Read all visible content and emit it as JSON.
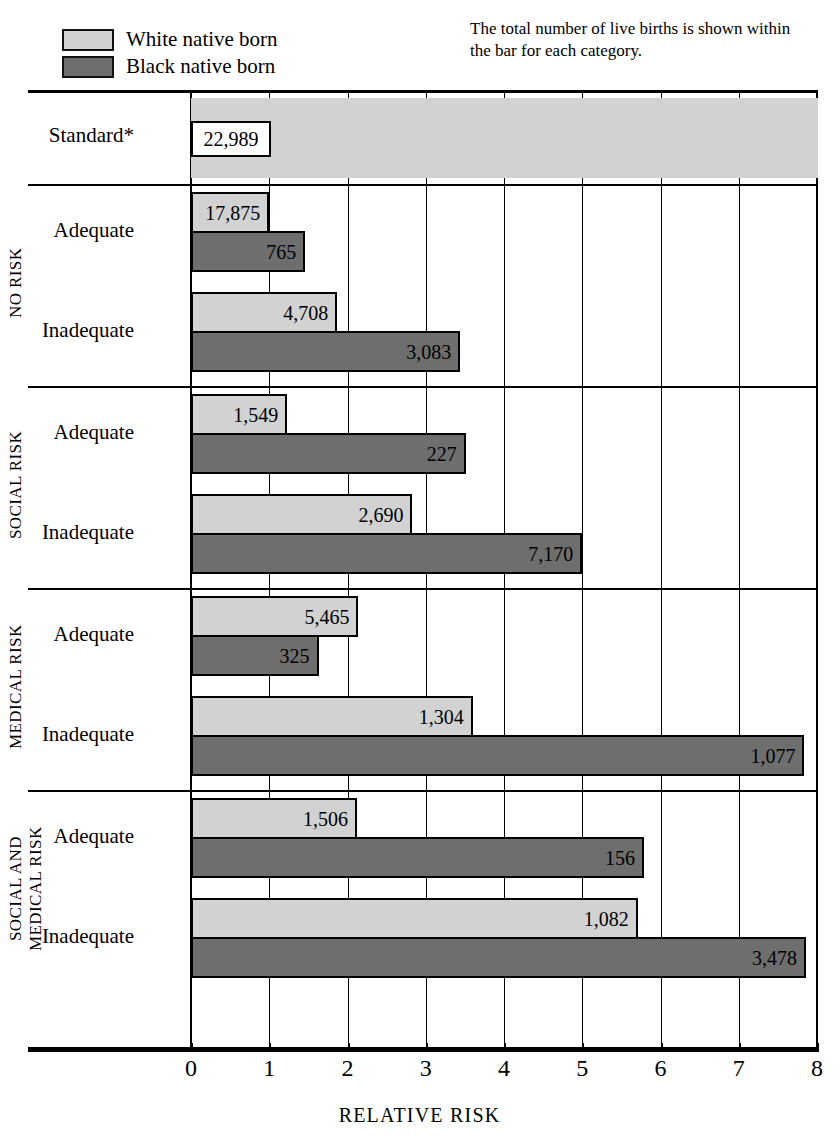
{
  "legend": {
    "items": [
      {
        "key": "white",
        "label": "White native born",
        "color": "#d2d2d2"
      },
      {
        "key": "black",
        "label": "Black native born",
        "color": "#6e6e6e"
      }
    ]
  },
  "note": "The total number of live births is shown within the bar for each category.",
  "axis": {
    "title": "RELATIVE RISK",
    "ticks": [
      "0",
      "1",
      "2",
      "3",
      "4",
      "5",
      "6",
      "7",
      "8"
    ],
    "min": 0,
    "max": 8
  },
  "standard": {
    "label": "Standard*",
    "value_label": "22,989",
    "relative_risk": 1.0
  },
  "groups": [
    {
      "name": "NO RISK",
      "rows": [
        {
          "label": "Adequate",
          "white": {
            "value_label": "17,875",
            "rr": 1.0
          },
          "black": {
            "value_label": "765",
            "rr": 1.46
          }
        },
        {
          "label": "Inadequate",
          "white": {
            "value_label": "4,708",
            "rr": 1.87
          },
          "black": {
            "value_label": "3,083",
            "rr": 3.44
          }
        }
      ]
    },
    {
      "name": "SOCIAL RISK",
      "rows": [
        {
          "label": "Adequate",
          "white": {
            "value_label": "1,549",
            "rr": 1.23
          },
          "black": {
            "value_label": "227",
            "rr": 3.51
          }
        },
        {
          "label": "Inadequate",
          "white": {
            "value_label": "2,690",
            "rr": 2.83
          },
          "black": {
            "value_label": "7,170",
            "rr": 5.0
          }
        }
      ]
    },
    {
      "name": "MEDICAL RISK",
      "rows": [
        {
          "label": "Adequate",
          "white": {
            "value_label": "5,465",
            "rr": 2.14
          },
          "black": {
            "value_label": "325",
            "rr": 1.63
          }
        },
        {
          "label": "Inadequate",
          "white": {
            "value_label": "1,304",
            "rr": 3.6
          },
          "black": {
            "value_label": "1,077",
            "rr": 7.84
          }
        }
      ]
    },
    {
      "name": "SOCIAL AND\nMEDICAL RISK",
      "rows": [
        {
          "label": "Adequate",
          "white": {
            "value_label": "1,506",
            "rr": 2.12
          },
          "black": {
            "value_label": "156",
            "rr": 5.79
          }
        },
        {
          "label": "Inadequate",
          "white": {
            "value_label": "1,082",
            "rr": 5.71
          },
          "black": {
            "value_label": "3,478",
            "rr": 7.86
          }
        }
      ]
    }
  ],
  "chart_data": {
    "type": "bar",
    "orientation": "horizontal",
    "title": "",
    "xlabel": "RELATIVE RISK",
    "ylabel": "",
    "xlim": [
      0,
      8
    ],
    "xticks": [
      0,
      1,
      2,
      3,
      4,
      5,
      6,
      7,
      8
    ],
    "grid": "vertical",
    "legend_position": "top-left",
    "note": "The total number of live births is shown within the bar for each category.",
    "series": [
      {
        "name": "White native born",
        "color": "#d2d2d2",
        "values": [
          1.0,
          1.0,
          1.87,
          1.23,
          2.83,
          2.14,
          3.6,
          2.12,
          5.71
        ],
        "data_labels": [
          "22,989",
          "17,875",
          "4,708",
          "1,549",
          "2,690",
          "5,465",
          "1,304",
          "1,506",
          "1,082"
        ]
      },
      {
        "name": "Black native born",
        "color": "#6e6e6e",
        "values": [
          null,
          1.46,
          3.44,
          3.51,
          5.0,
          1.63,
          7.84,
          5.79,
          7.86
        ],
        "data_labels": [
          null,
          "765",
          "3,083",
          "227",
          "7,170",
          "325",
          "1,077",
          "156",
          "3,478"
        ]
      }
    ],
    "categories": [
      "Standard*",
      "NO RISK — Adequate",
      "NO RISK — Inadequate",
      "SOCIAL RISK — Adequate",
      "SOCIAL RISK — Inadequate",
      "MEDICAL RISK — Adequate",
      "MEDICAL RISK — Inadequate",
      "SOCIAL AND MEDICAL RISK — Adequate",
      "SOCIAL AND MEDICAL RISK — Inadequate"
    ]
  }
}
